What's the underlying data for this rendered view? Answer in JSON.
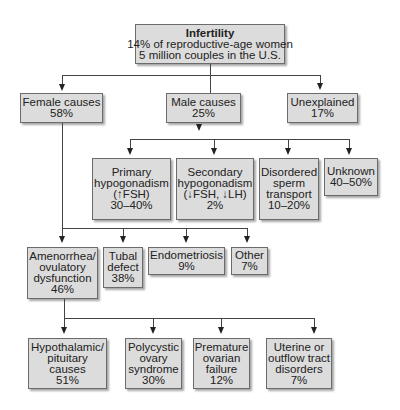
{
  "root": {
    "title": "Infertility",
    "line1": "14% of reproductive-age women",
    "line2": "5 million couples in the U.S."
  },
  "level1": {
    "female": {
      "label": "Female causes",
      "value": "58%"
    },
    "male": {
      "label": "Male causes",
      "value": "25%"
    },
    "unexplained": {
      "label": "Unexplained",
      "value": "17%"
    }
  },
  "male_causes": {
    "primary": {
      "line1": "Primary",
      "line2": "hypogonadism",
      "line3": "(↑FSH)",
      "value": "30–40%"
    },
    "secondary": {
      "line1": "Secondary",
      "line2": "hypogonadism",
      "line3": "(↓FSH, ↓LH)",
      "value": "2%"
    },
    "disordered": {
      "line1": "Disordered",
      "line2": "sperm",
      "line3": "transport",
      "value": "10–20%"
    },
    "unknown": {
      "line1": "Unknown",
      "value": "40–50%"
    }
  },
  "female_causes": {
    "amenorrhea": {
      "line1": "Amenorrhea/",
      "line2": "ovulatory",
      "line3": "dysfunction",
      "value": "46%"
    },
    "tubal": {
      "line1": "Tubal",
      "line2": "defect",
      "value": "38%"
    },
    "endometriosis": {
      "line1": "Endometriosis",
      "value": "9%"
    },
    "other": {
      "line1": "Other",
      "value": "7%"
    }
  },
  "amenorrhea_causes": {
    "hypothalamic": {
      "line1": "Hypothalamic/",
      "line2": "pituitary",
      "line3": "causes",
      "value": "51%"
    },
    "pcos": {
      "line1": "Polycystic",
      "line2": "ovary",
      "line3": "syndrome",
      "value": "30%"
    },
    "premature": {
      "line1": "Premature",
      "line2": "ovarian",
      "line3": "failure",
      "value": "12%"
    },
    "uterine": {
      "line1": "Uterine or",
      "line2": "outflow tract",
      "line3": "disorders",
      "value": "7%"
    }
  },
  "colors": {
    "box_fill": "#dcdcdc",
    "box_border": "#6b6b6b",
    "line": "#444444"
  }
}
